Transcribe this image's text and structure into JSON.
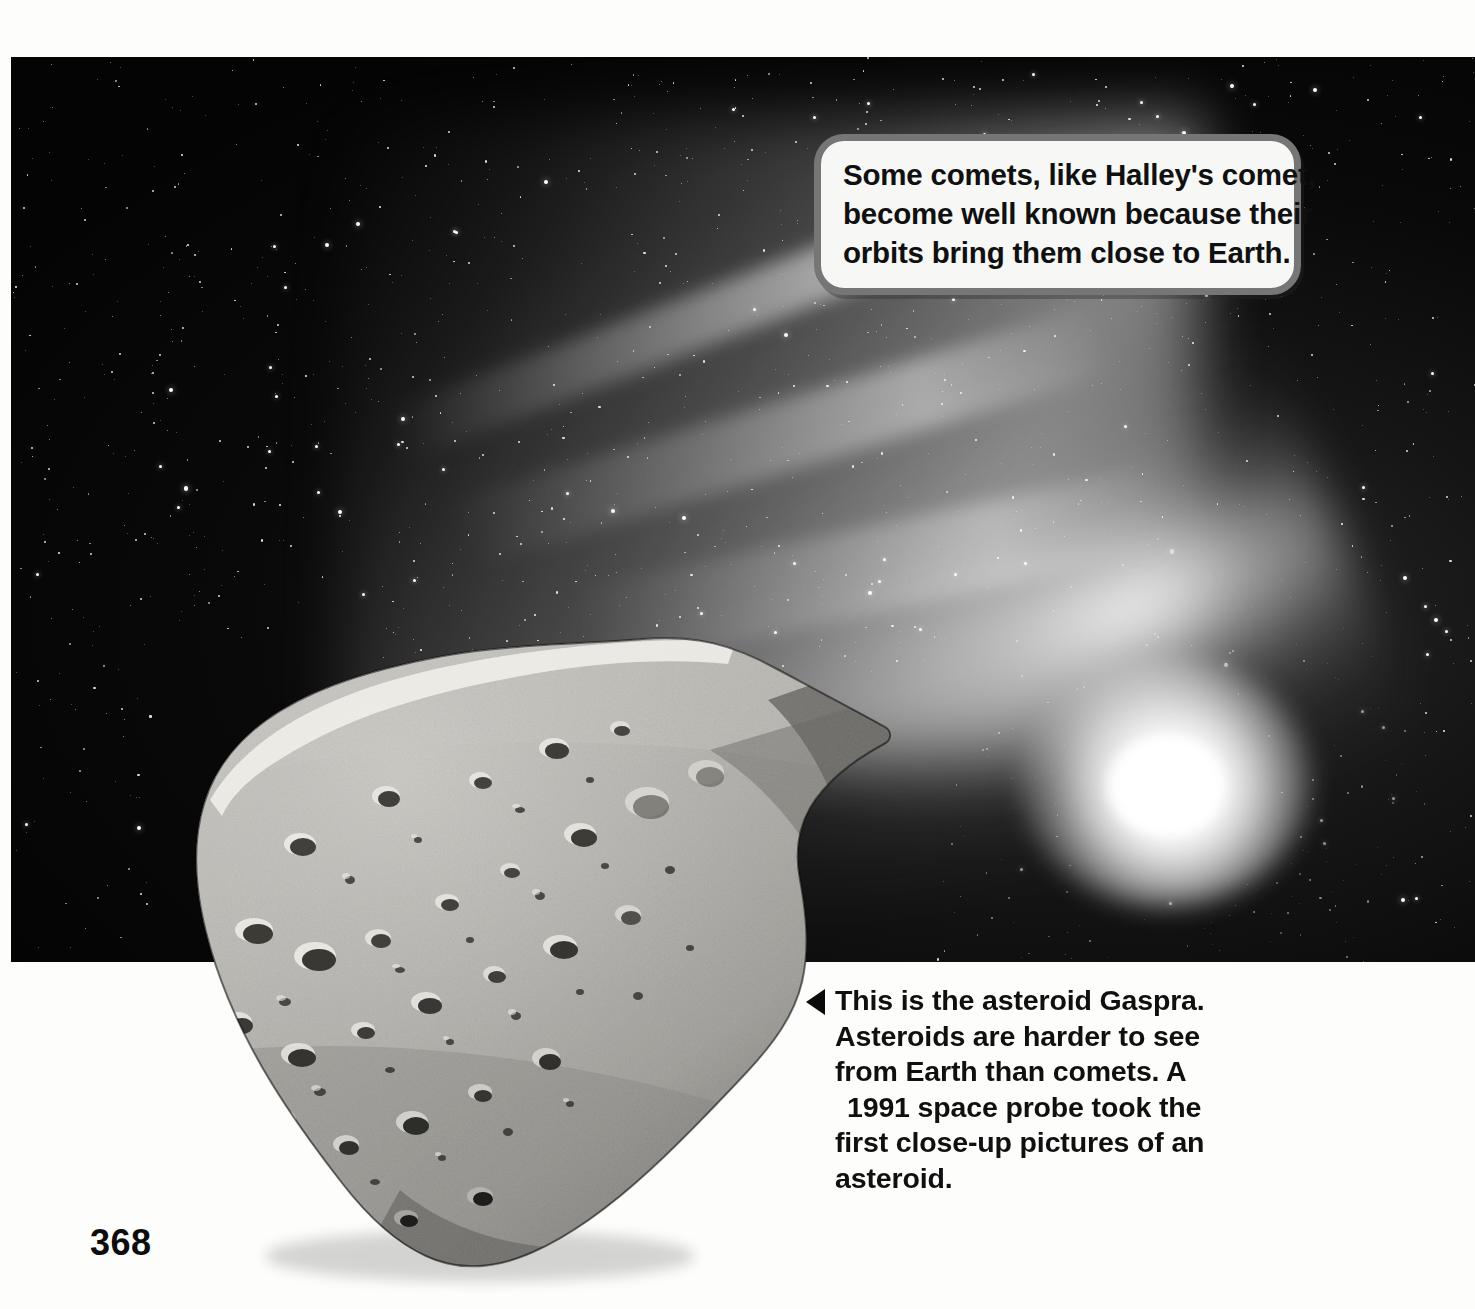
{
  "page": {
    "number": "368",
    "background_color": "#fdfdfb"
  },
  "photo": {
    "name": "comet-and-asteroid-photo",
    "background_color": "#000000",
    "subjects": [
      "starfield",
      "comet",
      "asteroid Gaspra"
    ]
  },
  "callout": {
    "name": "comet-callout",
    "border_color": "#767676",
    "fill_color": "#f7f7f5",
    "lines": [
      "Some comets, like Halley's comet,",
      "become well known because their",
      "orbits bring them close to Earth."
    ]
  },
  "caption": {
    "name": "asteroid-caption",
    "marker": "left-triangle",
    "lines": [
      "This is the asteroid Gaspra.",
      "Asteroids are harder to see",
      "from Earth than comets. A",
      "1991 space probe took the",
      "first close-up pictures of an",
      "asteroid."
    ]
  },
  "colors": {
    "space_black": "#000000",
    "comet_white": "#ffffff",
    "asteroid_gray": "#a8a8a8",
    "text_black": "#101010",
    "callout_border_gray": "#767676",
    "paper_white": "#fdfdfb"
  }
}
